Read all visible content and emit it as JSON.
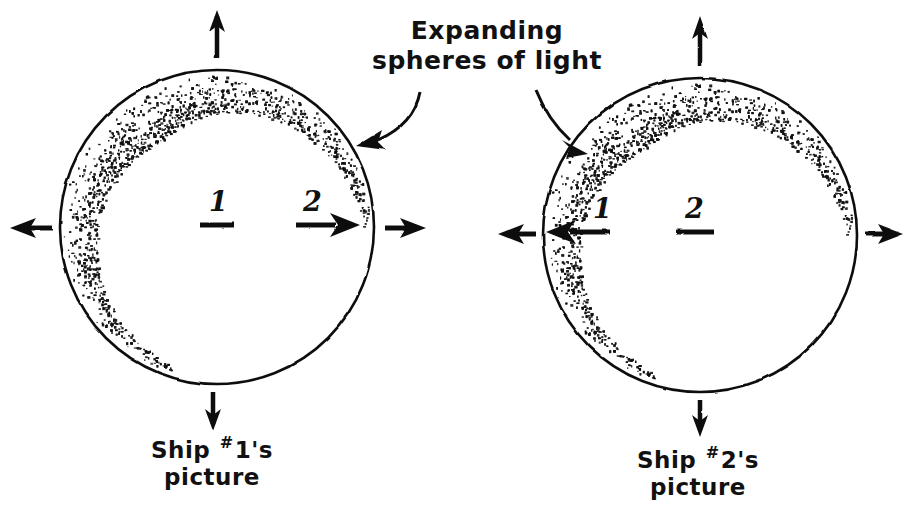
{
  "figure": {
    "title_label": "Expanding spheres of light",
    "background_color": "#ffffff",
    "ink_color": "#111111",
    "type": "hand-drawn-physics-diagram"
  },
  "annotation_arrows": {
    "name": "label-pointer-arrows",
    "count": 2,
    "targets": [
      "left-sphere-rim",
      "right-sphere-rim"
    ]
  },
  "panels": [
    {
      "id": "left",
      "caption_prefix": "Ship ",
      "caption_hash": "#",
      "caption_number": "1",
      "caption_suffix": "'s",
      "caption_line2": "picture",
      "sphere": {
        "cx": 217,
        "cy": 227,
        "r": 157
      },
      "inner_labels": [
        {
          "text": "1",
          "role": "own-ship-marker",
          "arrow": "none",
          "x": 209,
          "y": 186
        },
        {
          "text": "2",
          "role": "other-ship-marker",
          "arrow": "right",
          "x": 303,
          "y": 186
        }
      ],
      "outer_arrows": [
        "up",
        "down",
        "left",
        "right"
      ],
      "shading": "stippled crescent along lower inner rim"
    },
    {
      "id": "right",
      "caption_prefix": "Ship ",
      "caption_hash": "#",
      "caption_number": "2",
      "caption_suffix": "'s",
      "caption_line2": "picture",
      "sphere": {
        "cx": 700,
        "cy": 235,
        "r": 157
      },
      "inner_labels": [
        {
          "text": "1",
          "role": "other-ship-marker",
          "arrow": "left",
          "x": 593,
          "y": 193
        },
        {
          "text": "2",
          "role": "own-ship-marker",
          "arrow": "none",
          "x": 685,
          "y": 193
        }
      ],
      "outer_arrows": [
        "up",
        "down",
        "left",
        "right"
      ],
      "shading": "stippled crescent along lower inner rim"
    }
  ]
}
